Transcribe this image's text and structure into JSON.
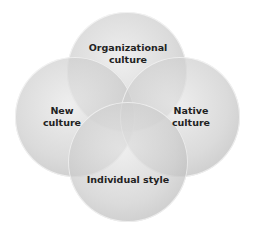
{
  "diagram": {
    "type": "venn",
    "circles": [
      {
        "id": "top",
        "label_lines": [
          "Organizational",
          "culture"
        ],
        "cx": 127,
        "cy": 72
      },
      {
        "id": "left",
        "label_lines": [
          "New",
          "culture"
        ],
        "cx": 75,
        "cy": 117
      },
      {
        "id": "right",
        "label_lines": [
          "Native",
          "culture"
        ],
        "cx": 180,
        "cy": 117
      },
      {
        "id": "bottom",
        "label_lines": [
          "Individual style"
        ],
        "cx": 128,
        "cy": 162
      }
    ]
  }
}
